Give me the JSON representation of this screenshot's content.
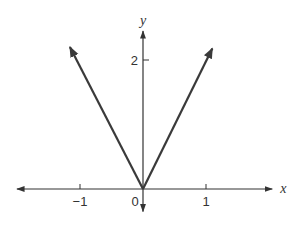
{
  "chart_data": {
    "type": "line",
    "title": "",
    "xlabel": "x",
    "ylabel": "y",
    "xlim": [
      -2.0,
      2.05
    ],
    "ylim": [
      -0.35,
      2.45
    ],
    "x_ticks": [
      {
        "value": -1,
        "label": "−1"
      },
      {
        "value": 1,
        "label": "1"
      }
    ],
    "y_ticks": [
      {
        "value": 2,
        "label": "2"
      }
    ],
    "origin_label": "0",
    "grid": false,
    "legend": "none",
    "series": [
      {
        "name": "y = 2|x| (left branch)",
        "x": [
          0,
          -1.16
        ],
        "y": [
          0,
          2.2
        ],
        "arrow_end": true
      },
      {
        "name": "y = 2|x| (right branch)",
        "x": [
          0,
          1.1
        ],
        "y": [
          0,
          2.18
        ],
        "arrow_end": true
      }
    ],
    "colors": {
      "axis": "#333333",
      "line": "#3a3a3a"
    }
  }
}
